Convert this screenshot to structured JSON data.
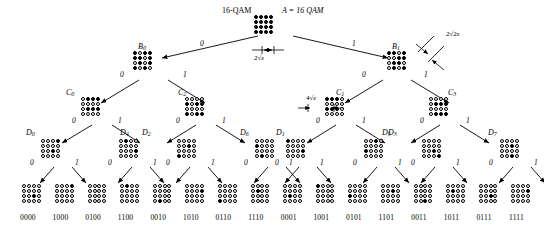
{
  "title": {
    "left": "16-QAM",
    "right": "A = 16 QAM"
  },
  "annotations": {
    "root_spacing": "2√ε",
    "b1_spacing": "2√2ε",
    "c1_spacing": "4√ε"
  },
  "branch_labels": {
    "zero": "0",
    "one": "1"
  },
  "levels": {
    "root": {
      "label": "",
      "pattern": "1111111111111111"
    },
    "b": [
      {
        "label": "B",
        "sub": "0",
        "pattern": "1011110101011010"
      },
      {
        "label": "B",
        "sub": "1",
        "pattern": "1101001101100101"
      }
    ],
    "c": [
      {
        "label": "C",
        "sub": "0",
        "pattern": "0111000001110000"
      },
      {
        "label": "C",
        "sub": "2",
        "pattern": "0000101100001011"
      },
      {
        "label": "C",
        "sub": "1",
        "pattern": "1110000011100000"
      },
      {
        "label": "C",
        "sub": "3",
        "pattern": "0000011100000111"
      }
    ],
    "d": [
      {
        "label": "D",
        "sub": "0",
        "pattern": "0001000000100000"
      },
      {
        "label": "D",
        "sub": "4",
        "pattern": "0100000000010000"
      },
      {
        "label": "D",
        "sub": "2",
        "pattern": "0000001000001000"
      },
      {
        "label": "D",
        "sub": "6",
        "pattern": "0000100000000100"
      },
      {
        "label": "D",
        "sub": "1",
        "pattern": "1000000000010000"
      },
      {
        "label": "D",
        "sub": "5",
        "pattern": "0010000010000000"
      },
      {
        "label": "D",
        "sub": "3",
        "pattern": "0000000000100001"
      },
      {
        "label": "D",
        "sub": "7",
        "pattern": "0000001000000010"
      }
    ],
    "leaves": [
      {
        "code": "0000",
        "pattern": "0000000000100000"
      },
      {
        "code": "1000",
        "pattern": "0001000000000000"
      },
      {
        "code": "0100",
        "pattern": "0000000000000000"
      },
      {
        "code": "1100",
        "pattern": "0100000000000000"
      },
      {
        "code": "0010",
        "pattern": "0000000000000100"
      },
      {
        "code": "1010",
        "pattern": "0000000100000000"
      },
      {
        "code": "0110",
        "pattern": "0000000000001000"
      },
      {
        "code": "1110",
        "pattern": "0000010000000000"
      },
      {
        "code": "0001",
        "pattern": "0000000001000000"
      },
      {
        "code": "1001",
        "pattern": "1000000000000000"
      },
      {
        "code": "0101",
        "pattern": "0000000010000000"
      },
      {
        "code": "1101",
        "pattern": "0000001000000000"
      },
      {
        "code": "0011",
        "pattern": "0000000000000010"
      },
      {
        "code": "1011",
        "pattern": "0000010000000000"
      },
      {
        "code": "0111",
        "pattern": "0000000000100000"
      },
      {
        "code": "1111",
        "pattern": "0000000100000000"
      }
    ]
  }
}
